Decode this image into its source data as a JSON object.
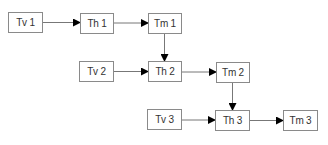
{
  "diagram": {
    "colors": {
      "box_border": "#8a8a8a",
      "text": "#333333",
      "edge_line": "#777777",
      "arrowhead": "#000000",
      "background": "#ffffff"
    },
    "nodes": [
      {
        "id": "tv1",
        "label": "Tv 1",
        "x": 8,
        "y": 12,
        "w": 35,
        "h": 21
      },
      {
        "id": "th1",
        "label": "Th 1",
        "x": 80,
        "y": 13,
        "w": 34,
        "h": 21
      },
      {
        "id": "tm1",
        "label": "Tm 1",
        "x": 148,
        "y": 13,
        "w": 34,
        "h": 21
      },
      {
        "id": "tv2",
        "label": "Tv 2",
        "x": 79,
        "y": 61,
        "w": 35,
        "h": 21
      },
      {
        "id": "th2",
        "label": "Th 2",
        "x": 148,
        "y": 61,
        "w": 34,
        "h": 21
      },
      {
        "id": "tm2",
        "label": "Tm 2",
        "x": 216,
        "y": 62,
        "w": 34,
        "h": 21
      },
      {
        "id": "tv3",
        "label": "Tv 3",
        "x": 147,
        "y": 109,
        "w": 35,
        "h": 21
      },
      {
        "id": "th3",
        "label": "Th 3",
        "x": 215,
        "y": 110,
        "w": 35,
        "h": 21
      },
      {
        "id": "tm3",
        "label": "Tm 3",
        "x": 283,
        "y": 110,
        "w": 35,
        "h": 21
      }
    ],
    "edges": [
      {
        "from": "tv1",
        "to": "th1"
      },
      {
        "from": "th1",
        "to": "tm1"
      },
      {
        "from": "tm1",
        "to": "th2"
      },
      {
        "from": "tv2",
        "to": "th2"
      },
      {
        "from": "th2",
        "to": "tm2"
      },
      {
        "from": "tm2",
        "to": "th3"
      },
      {
        "from": "tv3",
        "to": "th3"
      },
      {
        "from": "th3",
        "to": "tm3"
      }
    ]
  }
}
